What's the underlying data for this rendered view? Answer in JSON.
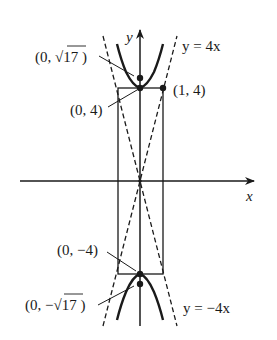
{
  "diagram": {
    "type": "hyperbola-graph",
    "equation_implied": "y^2/16 - x^2 = 1",
    "axes": {
      "x_label": "x",
      "y_label": "y"
    },
    "labels": {
      "focus_top": "(0, √17 )",
      "vertex_top": "(0, 4)",
      "corner": "(1, 4)",
      "vertex_bottom": "(0, −4)",
      "focus_bottom": "(0, −√17 )",
      "asymptote_top": "y = 4x",
      "asymptote_bottom": "y = −4x"
    },
    "points": [
      {
        "name": "focus_top",
        "x": 0,
        "y": 4.123
      },
      {
        "name": "vertex_top",
        "x": 0,
        "y": 4
      },
      {
        "name": "corner",
        "x": 1,
        "y": 4
      },
      {
        "name": "vertex_bottom",
        "x": 0,
        "y": -4
      },
      {
        "name": "focus_bottom",
        "x": 0,
        "y": -4.123
      }
    ],
    "asymptotes": [
      "y = 4x",
      "y = -4x"
    ],
    "fundamental_rectangle": {
      "x": [
        -1,
        1
      ],
      "y": [
        -4,
        4
      ]
    },
    "colors": {
      "stroke": "#1a1a1a",
      "background": "#ffffff"
    }
  }
}
